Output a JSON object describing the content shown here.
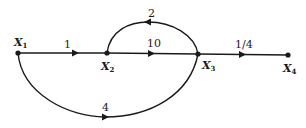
{
  "diagram": {
    "type": "signal-flow-graph",
    "nodes": [
      {
        "id": "X1",
        "label": "X",
        "sub": "1"
      },
      {
        "id": "X2",
        "label": "X",
        "sub": "2"
      },
      {
        "id": "X3",
        "label": "X",
        "sub": "3"
      },
      {
        "id": "X4",
        "label": "X",
        "sub": "4"
      }
    ],
    "edges": [
      {
        "from": "X1",
        "to": "X2",
        "gain": "1"
      },
      {
        "from": "X2",
        "to": "X3",
        "gain": "10"
      },
      {
        "from": "X3",
        "to": "X2",
        "gain": "2"
      },
      {
        "from": "X3",
        "to": "X4",
        "gain": "1/4"
      },
      {
        "from": "X1",
        "to": "X3",
        "gain": "4"
      }
    ]
  }
}
